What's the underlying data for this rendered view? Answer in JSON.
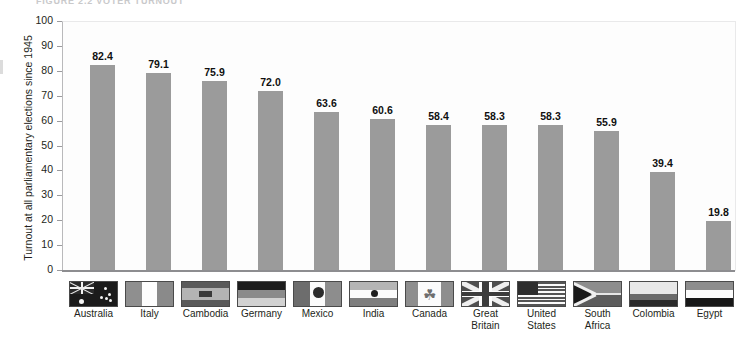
{
  "figure": {
    "caption": "FIGURE 2.2   VOTER TURNOUT"
  },
  "chart_data": {
    "type": "bar",
    "title": "",
    "subtitle": "",
    "xlabel": "",
    "ylabel": "Turnout at all parliamentary elections since 1945",
    "ylim": [
      0,
      100
    ],
    "yticks": [
      0,
      10,
      20,
      30,
      40,
      50,
      60,
      70,
      80,
      90,
      100
    ],
    "grid": false,
    "legend": "none",
    "bar_color": "#9b9b9b",
    "categories": [
      "Australia",
      "Italy",
      "Cambodia",
      "Germany",
      "Mexico",
      "India",
      "Canada",
      "Great Britain",
      "United States",
      "South Africa",
      "Colombia",
      "Egypt"
    ],
    "category_lines": [
      [
        "Australia"
      ],
      [
        "Italy"
      ],
      [
        "Cambodia"
      ],
      [
        "Germany"
      ],
      [
        "Mexico"
      ],
      [
        "India"
      ],
      [
        "Canada"
      ],
      [
        "Great",
        "Britain"
      ],
      [
        "United",
        "States"
      ],
      [
        "South",
        "Africa"
      ],
      [
        "Colombia"
      ],
      [
        "Egypt"
      ]
    ],
    "values": [
      82.4,
      79.1,
      75.9,
      72.0,
      63.6,
      60.6,
      58.4,
      58.3,
      58.3,
      55.9,
      39.4,
      19.8
    ],
    "value_labels": [
      "82.4",
      "79.1",
      "75.9",
      "72.0",
      "63.6",
      "60.6",
      "58.4",
      "58.3",
      "58.3",
      "55.9",
      "39.4",
      "19.8"
    ],
    "flag_icons": [
      "flag-australia-icon",
      "flag-italy-icon",
      "flag-cambodia-icon",
      "flag-germany-icon",
      "flag-mexico-icon",
      "flag-india-icon",
      "flag-canada-icon",
      "flag-great-britain-icon",
      "flag-united-states-icon",
      "flag-south-africa-icon",
      "flag-colombia-icon",
      "flag-egypt-icon"
    ]
  }
}
